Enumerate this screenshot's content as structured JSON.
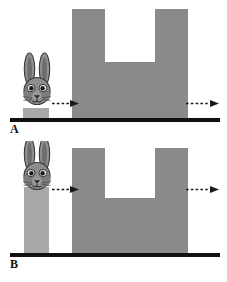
{
  "figure": {
    "background_color": "#ffffff",
    "width": 227,
    "height": 282
  },
  "colors": {
    "ground_line": "#111111",
    "u_block_gray": "#8a8a8a",
    "pillar_gray": "#a9a9a9",
    "arrow_dark": "#1a1a1a",
    "label_text": "#111111",
    "rabbit_fur": "#8f8f8f",
    "rabbit_fur_dark": "#6a6a6a",
    "rabbit_outline": "#3a3a3a",
    "rabbit_inner_ear": "#b5b5b5"
  },
  "panels": [
    {
      "id": "panel-a",
      "label": "A",
      "rabbit": {
        "name": "rabbit-head",
        "description": "front-facing rabbit head with two tall upright ears",
        "perch": "short-block"
      },
      "pillar": {
        "name": "short-pedestal",
        "height_px": 10,
        "color": "#a9a9a9"
      },
      "u_block": {
        "name": "u-shaped-barrier",
        "color": "#8a8a8a",
        "notch_open": "top"
      },
      "arrows": [
        {
          "name": "arrow-left-motion",
          "style": "dashed",
          "direction": "right"
        },
        {
          "name": "arrow-right-motion",
          "style": "dashed",
          "direction": "right"
        }
      ]
    },
    {
      "id": "panel-b",
      "label": "B",
      "rabbit": {
        "name": "rabbit-head",
        "description": "front-facing rabbit head with two tall upright ears",
        "perch": "tall-pillar"
      },
      "pillar": {
        "name": "tall-pedestal",
        "height_px": 66,
        "color": "#a9a9a9"
      },
      "u_block": {
        "name": "u-shaped-barrier",
        "color": "#8a8a8a",
        "notch_open": "top"
      },
      "arrows": [
        {
          "name": "arrow-left-motion",
          "style": "dashed",
          "direction": "right"
        },
        {
          "name": "arrow-right-motion",
          "style": "dashed",
          "direction": "right"
        }
      ]
    }
  ]
}
